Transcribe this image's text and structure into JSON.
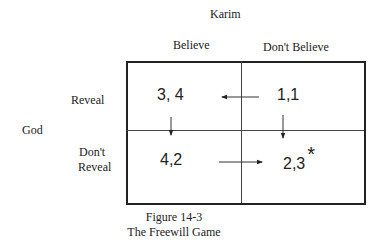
{
  "diagram": {
    "type": "payoff-matrix",
    "column_player": "Karim",
    "row_player": "God",
    "columns": [
      "Believe",
      "Don't Believe"
    ],
    "rows": [
      {
        "label_line1": "Reveal",
        "label_line2": ""
      },
      {
        "label_line1": "Don't",
        "label_line2": "Reveal"
      }
    ],
    "cells": [
      [
        "3, 4",
        "1,1"
      ],
      [
        "4,2",
        "2,3"
      ]
    ],
    "equilibrium_marker": "*",
    "equilibrium_cell": [
      1,
      1
    ],
    "arrows": [
      {
        "from": "1,1",
        "to": "3, 4",
        "direction": "left"
      },
      {
        "from": "3, 4",
        "to": "4,2",
        "direction": "down"
      },
      {
        "from": "1,1",
        "to": "2,3",
        "direction": "down"
      },
      {
        "from": "4,2",
        "to": "2,3",
        "direction": "right"
      }
    ]
  },
  "caption": {
    "line1": "Figure 14-3",
    "line2": "The Freewill Game"
  }
}
